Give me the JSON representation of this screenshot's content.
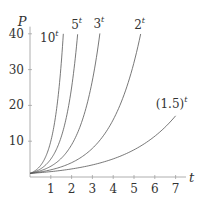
{
  "chart_data": {
    "type": "line",
    "title": "",
    "xlabel": "t",
    "ylabel": "P",
    "xlim": [
      0,
      7.5
    ],
    "ylim": [
      0,
      42
    ],
    "x_ticks": [
      1,
      2,
      3,
      4,
      5,
      6,
      7
    ],
    "y_ticks": [
      10,
      20,
      30,
      40
    ],
    "grid": false,
    "legend": "none (inline labels at curve ends)",
    "series": [
      {
        "name": "10^t",
        "base": 10,
        "label_base": "10",
        "label_exp": "t",
        "t_start": 0,
        "t_end": 1.602
      },
      {
        "name": "5^t",
        "base": 5,
        "label_base": "5",
        "label_exp": "t",
        "t_start": 0,
        "t_end": 2.29
      },
      {
        "name": "3^t",
        "base": 3,
        "label_base": "3",
        "label_exp": "t",
        "t_start": 0,
        "t_end": 3.36
      },
      {
        "name": "2^t",
        "base": 2,
        "label_base": "2",
        "label_exp": "t",
        "t_start": 0,
        "t_end": 5.32
      },
      {
        "name": "(1.5)^t",
        "base": 1.5,
        "label_base": "(1.5)",
        "label_exp": "t",
        "t_start": 0,
        "t_end": 7
      }
    ],
    "line_color": "#555555",
    "axis_color": "#999999"
  }
}
